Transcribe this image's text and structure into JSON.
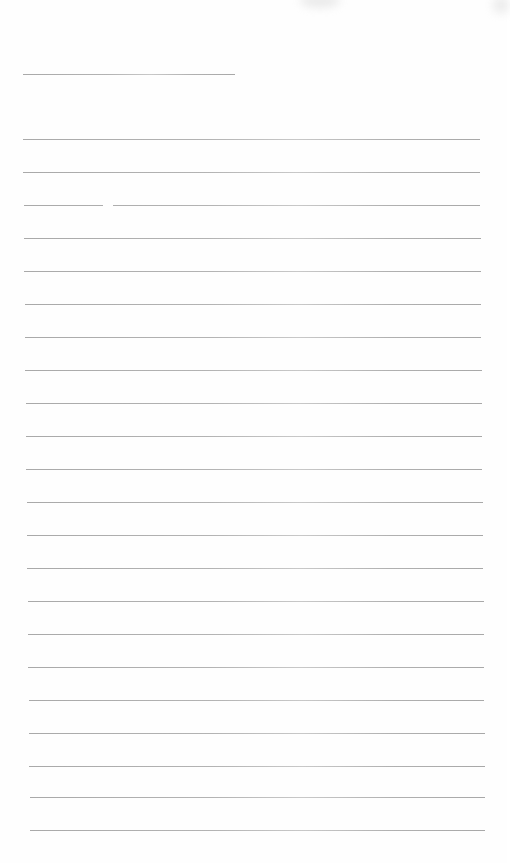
{
  "document": {
    "type": "blank lined writing sheet",
    "background_color": "#fefefe",
    "rule_color": "#b0b0b0",
    "name_line": {
      "y": 74,
      "x1": 23,
      "x2": 235
    },
    "rules": [
      {
        "y": 139,
        "x1": 23,
        "x2": 480
      },
      {
        "y": 172,
        "x1": 23,
        "x2": 480
      },
      {
        "y": 205,
        "x1": 24,
        "x2": 480,
        "gap": [
          103,
          113
        ]
      },
      {
        "y": 238,
        "x1": 24,
        "x2": 481
      },
      {
        "y": 271,
        "x1": 24,
        "x2": 481
      },
      {
        "y": 304,
        "x1": 25,
        "x2": 481
      },
      {
        "y": 337,
        "x1": 25,
        "x2": 481
      },
      {
        "y": 370,
        "x1": 25,
        "x2": 482
      },
      {
        "y": 403,
        "x1": 26,
        "x2": 482
      },
      {
        "y": 436,
        "x1": 26,
        "x2": 482
      },
      {
        "y": 469,
        "x1": 26,
        "x2": 482
      },
      {
        "y": 502,
        "x1": 27,
        "x2": 483
      },
      {
        "y": 535,
        "x1": 27,
        "x2": 483
      },
      {
        "y": 568,
        "x1": 27,
        "x2": 483
      },
      {
        "y": 601,
        "x1": 28,
        "x2": 484
      },
      {
        "y": 634,
        "x1": 28,
        "x2": 484
      },
      {
        "y": 667,
        "x1": 28,
        "x2": 484
      },
      {
        "y": 700,
        "x1": 29,
        "x2": 484
      },
      {
        "y": 733,
        "x1": 29,
        "x2": 485
      },
      {
        "y": 766,
        "x1": 29,
        "x2": 485
      },
      {
        "y": 797,
        "x1": 30,
        "x2": 485
      },
      {
        "y": 830,
        "x1": 30,
        "x2": 485
      }
    ],
    "smudges": [
      {
        "x": 300,
        "y": -6,
        "w": 40,
        "h": 14,
        "color": "#c8c8c8"
      },
      {
        "x": 492,
        "y": -4,
        "w": 18,
        "h": 18,
        "color": "#d0d0d0"
      }
    ]
  }
}
